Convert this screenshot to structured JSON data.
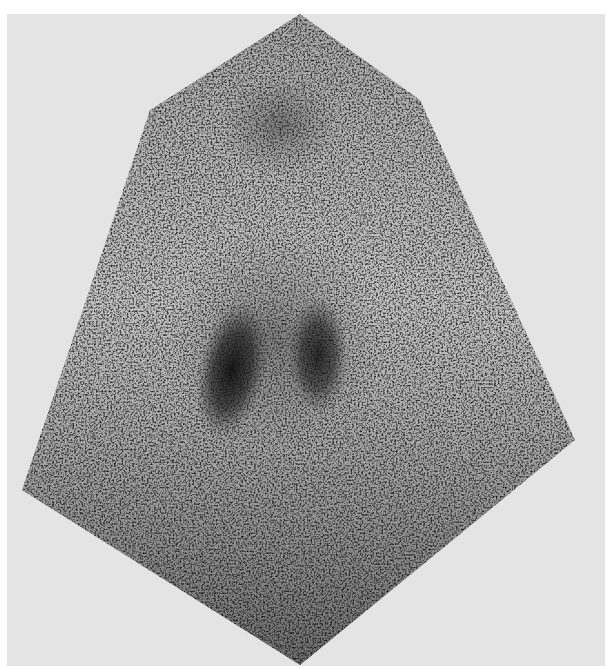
{
  "image": {
    "kind": "grayscale scintigraphy scan",
    "background_color": "#e4e4e4",
    "border_color": "#ffffff",
    "field_shape": "hexagon",
    "field_vertices": [
      [
        300,
        14
      ],
      [
        420,
        100
      ],
      [
        575,
        440
      ],
      [
        300,
        665
      ],
      [
        22,
        490
      ],
      [
        150,
        110
      ]
    ],
    "hot_spots": [
      {
        "name": "left-focus",
        "cx": 232,
        "cy": 365,
        "rx": 32,
        "ry": 62
      },
      {
        "name": "right-focus",
        "cx": 318,
        "cy": 355,
        "rx": 28,
        "ry": 55
      },
      {
        "name": "upper-focus",
        "cx": 280,
        "cy": 125,
        "rx": 40,
        "ry": 35
      }
    ]
  }
}
